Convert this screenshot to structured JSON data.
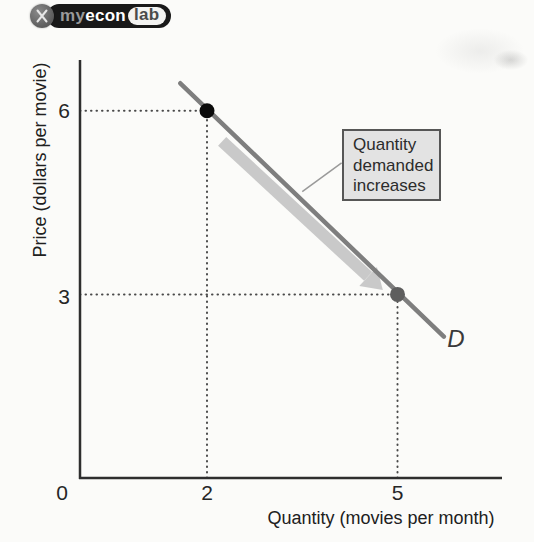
{
  "logo": {
    "icon": "x-monogram",
    "parts": {
      "my": "my",
      "econ": "econ",
      "lab": "lab"
    }
  },
  "chart_data": {
    "type": "line",
    "title": "",
    "xlabel": "Quantity (movies per month)",
    "ylabel": "Price (dollars per movie)",
    "xlim": [
      0,
      6.6
    ],
    "ylim": [
      0,
      6.8
    ],
    "grid": false,
    "x_ticks": [
      {
        "value": 0,
        "label": "0"
      },
      {
        "value": 2,
        "label": "2"
      },
      {
        "value": 5,
        "label": "5"
      }
    ],
    "y_ticks": [
      {
        "value": 6,
        "label": "6"
      },
      {
        "value": 3,
        "label": "3"
      }
    ],
    "series": [
      {
        "name": "Demand curve",
        "label": "D",
        "color": "#7e7e7e",
        "extent": [
          [
            1.58,
            6.45
          ],
          [
            5.73,
            2.31
          ]
        ],
        "points": [
          {
            "x": 2,
            "y": 6,
            "marker_color": "#0b0b0b"
          },
          {
            "x": 5,
            "y": 3,
            "marker_color": "#5e5e5e"
          }
        ]
      }
    ],
    "guides": [
      {
        "x1": 0,
        "y1": 6,
        "x2": 2,
        "y2": 6
      },
      {
        "x1": 2,
        "y1": 0,
        "x2": 2,
        "y2": 6
      },
      {
        "x1": 0,
        "y1": 3,
        "x2": 5,
        "y2": 3
      },
      {
        "x1": 5,
        "y1": 0,
        "x2": 5,
        "y2": 3
      }
    ],
    "arrow": {
      "from": [
        2.27,
        5.55
      ],
      "to": [
        4.8,
        3.12
      ],
      "color": "#c9c9c9"
    },
    "annotation": {
      "lines": [
        "Quantity",
        "demanded",
        "increases"
      ],
      "leader_from": [
        4.12,
        5.15
      ],
      "leader_to": [
        3.5,
        4.68
      ],
      "box_fill": "#e3e3e3",
      "box_border": "#565656"
    }
  },
  "colors": {
    "axis": "#2e2e2e",
    "dotted": "#4a4a4a",
    "background": "#fbfbf9",
    "tick_text": "#262626"
  }
}
